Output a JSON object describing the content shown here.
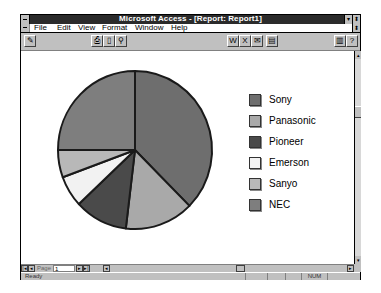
{
  "window": {
    "title": "Microsoft Access - [Report: Report1]",
    "minimize_icon": "▾",
    "maximize_icon": "⬍"
  },
  "menu": {
    "items": [
      {
        "label": "File"
      },
      {
        "label": "Edit"
      },
      {
        "label": "View"
      },
      {
        "label": "Format"
      },
      {
        "label": "Window"
      },
      {
        "label": "Help"
      }
    ],
    "restore_icon": "⬍"
  },
  "toolbar": {
    "design_view": "✎",
    "print": "⎙",
    "page_setup": "▯",
    "zoom": "⚲",
    "publish_word": "W",
    "analyze_excel": "X",
    "mail_it": "✉",
    "database_window": "▤",
    "new_object": "▥",
    "help": "?"
  },
  "navigation": {
    "first": "|◂",
    "prev": "◂",
    "page_label": "Page",
    "page_value": "1",
    "next": "▸",
    "last": "▸|",
    "scroll_left": "◂",
    "scroll_right": "▸"
  },
  "vscroll": {
    "up": "▴",
    "down": "▾"
  },
  "status": {
    "text": "Ready",
    "num_indicator": "NUM"
  },
  "chart_data": {
    "type": "pie",
    "title": "",
    "categories": [
      "Sony",
      "Panasonic",
      "Pioneer",
      "Emerson",
      "Sanyo",
      "NEC"
    ],
    "values": [
      37.5,
      14.4,
      11.1,
      6.4,
      5.6,
      25.0
    ],
    "colors": [
      "#6e6e6e",
      "#a9a9a9",
      "#4a4a4a",
      "#f2f2f2",
      "#b8b8b8",
      "#7e7e7e"
    ],
    "start_angle_deg": 0,
    "direction": "clockwise",
    "legend_position": "right"
  }
}
